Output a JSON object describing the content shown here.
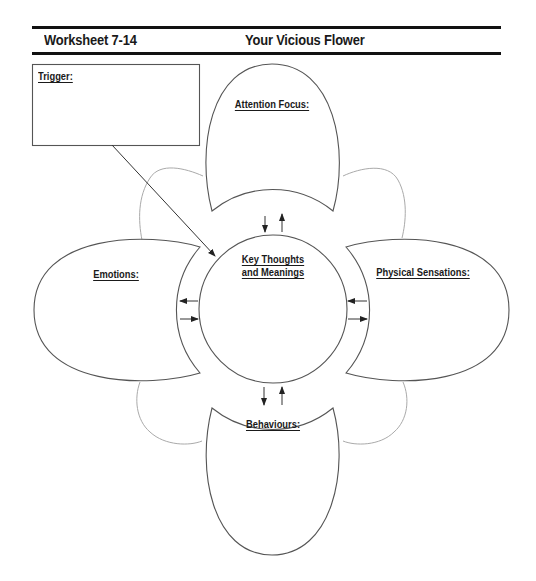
{
  "header": {
    "worksheet_id": "Worksheet 7-14",
    "title": "Your Vicious Flower"
  },
  "diagram": {
    "trigger": {
      "label": "Trigger:",
      "value": ""
    },
    "center": {
      "label_line1": "Key Thoughts",
      "label_line2": "and Meanings",
      "value": ""
    },
    "petals": {
      "top": {
        "label": "Attention Focus:",
        "value": ""
      },
      "left": {
        "label": "Emotions:",
        "value": ""
      },
      "right": {
        "label": "Physical Sensations:",
        "value": ""
      },
      "bottom": {
        "label": "Behaviours:",
        "value": ""
      }
    },
    "colors": {
      "outline": "#555555",
      "back_petal": "#aaaaaa",
      "rule": "#111111"
    }
  }
}
